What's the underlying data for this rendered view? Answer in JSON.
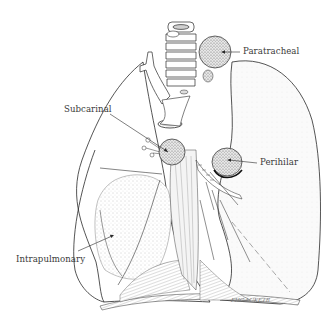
{
  "figure": {
    "background": "#ffffff",
    "line_color": "#2a2a2a",
    "stipple_color": "#9a9a9a",
    "labels": [
      {
        "id": "paratracheal",
        "text": "Paratracheal"
      },
      {
        "id": "subcarinal",
        "text": "Subcarinal"
      },
      {
        "id": "perihilar",
        "text": "Perihilar"
      },
      {
        "id": "intrapulmonary",
        "text": "Intrapulmonary"
      }
    ],
    "signature": "FHG-LUKETB"
  }
}
